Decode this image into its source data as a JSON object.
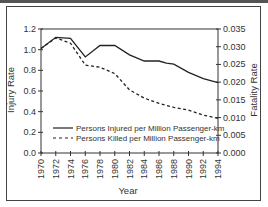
{
  "chart_data": {
    "type": "line",
    "title": "",
    "xlabel": "Year",
    "ylabel": "Injury Rate",
    "y2label": "Fatality Rate",
    "x": [
      1970,
      1972,
      1974,
      1976,
      1978,
      1980,
      1982,
      1984,
      1986,
      1987,
      1988,
      1990,
      1992,
      1994
    ],
    "x_ticks": [
      "1970",
      "1972",
      "1974",
      "1976",
      "1978",
      "1980",
      "1982",
      "1984",
      "1986",
      "1988",
      "1990",
      "1992",
      "1994"
    ],
    "y_ticks": [
      "0.0",
      "0.2",
      "0.4",
      "0.6",
      "0.8",
      "1.0",
      "1.2"
    ],
    "y2_ticks": [
      "0.000",
      "0.005",
      "0.010",
      "0.015",
      "0.020",
      "0.025",
      "0.030",
      "0.035"
    ],
    "ylim": [
      0,
      1.2
    ],
    "y2lim": [
      0,
      0.035
    ],
    "xlim": [
      1970,
      1994
    ],
    "grid": false,
    "legend_position": "lower center inside",
    "series": [
      {
        "name": "Persons Injured per Million Passenger-km",
        "axis": "left",
        "style": "solid",
        "x": [
          1970,
          1972,
          1974,
          1976,
          1978,
          1980,
          1982,
          1984,
          1986,
          1987,
          1988,
          1990,
          1992,
          1994
        ],
        "values": [
          1.01,
          1.12,
          1.11,
          0.93,
          1.04,
          1.04,
          0.95,
          0.89,
          0.89,
          0.87,
          0.86,
          0.78,
          0.72,
          0.68
        ]
      },
      {
        "name": "Persons Killed per Million Passenger-km",
        "axis": "right",
        "style": "dashed",
        "x": [
          1970,
          1972,
          1974,
          1976,
          1978,
          1980,
          1982,
          1984,
          1986,
          1988,
          1990,
          1992,
          1994
        ],
        "values": [
          0.0295,
          0.0325,
          0.031,
          0.0248,
          0.0242,
          0.0224,
          0.0178,
          0.0155,
          0.014,
          0.0129,
          0.0121,
          0.0107,
          0.0098
        ]
      }
    ]
  },
  "legend": {
    "injured_label": "Persons Injured per Million Passenger-km",
    "killed_label": "Persons Killed per Million Passenger-km"
  },
  "axes": {
    "xlabel": "Year",
    "ylabel": "Injury Rate",
    "y2label": "Fatality Rate"
  }
}
